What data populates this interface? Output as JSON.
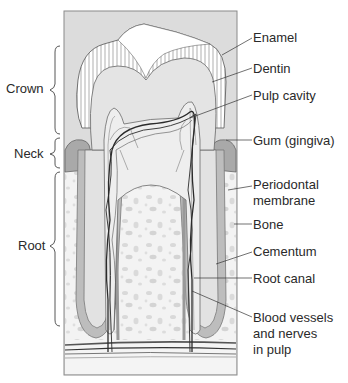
{
  "figure": {
    "colors": {
      "panel_bg": "#dcdcdc",
      "panel_border": "#8a8a8a",
      "enamel": "#ffffff",
      "dentin": "#e4e4e4",
      "pulp": "#eeeeee",
      "cementum": "#bdbdbd",
      "gum": "#a8a8a8",
      "bone": "#f2f2f2",
      "bone_spots": "#d6d6d6",
      "vessels": "#2b2b2b",
      "leader": "#333333",
      "text": "#2a2a2a"
    }
  },
  "regions": {
    "crown": "Crown",
    "neck": "Neck",
    "root": "Root"
  },
  "labels": {
    "enamel": "Enamel",
    "dentin": "Dentin",
    "pulp_cavity": "Pulp cavity",
    "gum": "Gum (gingiva)",
    "periodontal_1": "Periodontal",
    "periodontal_2": "membrane",
    "bone": "Bone",
    "cementum": "Cementum",
    "root_canal": "Root canal",
    "vessels_1": "Blood vessels",
    "vessels_2": "and nerves",
    "vessels_3": "in pulp"
  }
}
